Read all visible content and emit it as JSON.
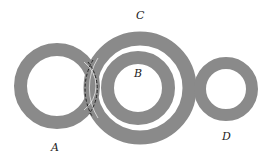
{
  "diagram": {
    "type": "concentric-rings",
    "ring_color": "#8a8a8a",
    "background": "#ffffff",
    "dash_color": "#1a1a1a",
    "labels": {
      "A": "A",
      "B": "B",
      "C": "C",
      "D": "D"
    },
    "rings": [
      {
        "id": "A",
        "label": "A",
        "note": "ring overlapping C"
      },
      {
        "id": "C",
        "label": "C",
        "note": "large ring enclosing B"
      },
      {
        "id": "B",
        "label": "B",
        "note": "ring inside C"
      },
      {
        "id": "D",
        "label": "D",
        "note": "separate small ring"
      }
    ]
  }
}
